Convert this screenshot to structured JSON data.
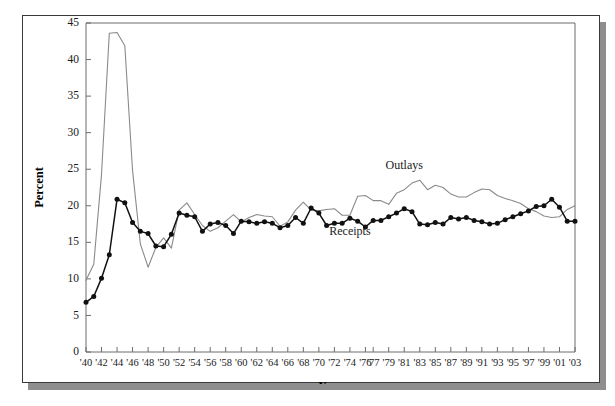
{
  "chart_data": {
    "type": "line",
    "title": "",
    "xlabel": "Year",
    "ylabel": "Percent",
    "grid": false,
    "legend_position": "inline-annotation",
    "xlim": [
      1940,
      2003
    ],
    "ylim": [
      0,
      45
    ],
    "ytick_values": [
      0,
      5,
      10,
      15,
      20,
      25,
      30,
      35,
      40,
      45
    ],
    "ytick_labels": [
      "0",
      "5",
      "10",
      "15",
      "20",
      "25",
      "30",
      "35",
      "40",
      "45"
    ],
    "xtick_labels": [
      "'40",
      "'42",
      "'44",
      "'46",
      "'48",
      "'50",
      "'52",
      "'54",
      "'56",
      "'58",
      "'60",
      "'62",
      "'64",
      "'66",
      "'68",
      "'70",
      "'72",
      "'74",
      "'76",
      "'77",
      "'79",
      "'81",
      "'83",
      "'85",
      "'87",
      "'89",
      "'91",
      "'93",
      "'95",
      "'97",
      "'99",
      "'01",
      "'03"
    ],
    "xtick_years": [
      1940,
      1942,
      1944,
      1946,
      1948,
      1950,
      1952,
      1954,
      1956,
      1958,
      1960,
      1962,
      1964,
      1966,
      1968,
      1970,
      1972,
      1974,
      1976,
      1977,
      1979,
      1981,
      1983,
      1985,
      1987,
      1989,
      1991,
      1993,
      1995,
      1997,
      1999,
      2001,
      2003
    ],
    "x": [
      1940,
      1941,
      1942,
      1943,
      1944,
      1945,
      1946,
      1947,
      1948,
      1949,
      1950,
      1951,
      1952,
      1953,
      1954,
      1955,
      1956,
      1957,
      1958,
      1959,
      1960,
      1961,
      1962,
      1963,
      1964,
      1965,
      1966,
      1967,
      1968,
      1969,
      1970,
      1971,
      1972,
      1973,
      1974,
      1975,
      1976,
      1977,
      1978,
      1979,
      1980,
      1981,
      1982,
      1983,
      1984,
      1985,
      1986,
      1987,
      1988,
      1989,
      1990,
      1991,
      1992,
      1993,
      1994,
      1995,
      1996,
      1997,
      1998,
      1999,
      2000,
      2001,
      2002,
      2003
    ],
    "series": [
      {
        "name": "Outlays",
        "color": "#8a8a8a",
        "marker": "none",
        "annotation": "Outlays",
        "annotation_x": 1981,
        "annotation_y": 25.0,
        "values": [
          9.8,
          12.0,
          24.3,
          43.6,
          43.7,
          41.9,
          24.8,
          14.8,
          11.6,
          14.3,
          15.6,
          14.2,
          19.4,
          20.4,
          18.8,
          17.3,
          16.5,
          17.0,
          17.9,
          18.8,
          17.8,
          18.4,
          18.8,
          18.6,
          18.5,
          17.2,
          17.8,
          19.4,
          20.5,
          19.4,
          19.3,
          19.5,
          19.6,
          18.7,
          18.7,
          21.3,
          21.4,
          20.7,
          20.7,
          20.2,
          21.7,
          22.2,
          23.1,
          23.5,
          22.2,
          22.8,
          22.5,
          21.6,
          21.2,
          21.2,
          21.8,
          22.3,
          22.2,
          21.4,
          21.0,
          20.7,
          20.3,
          19.6,
          19.2,
          18.6,
          18.4,
          18.5,
          19.5,
          20.0
        ]
      },
      {
        "name": "Receipts",
        "color": "#111111",
        "marker": "filled-circle",
        "annotation": "Receipts",
        "annotation_x": 1974,
        "annotation_y": 16.0,
        "values": [
          6.8,
          7.6,
          10.1,
          13.3,
          20.9,
          20.4,
          17.7,
          16.5,
          16.2,
          14.5,
          14.4,
          16.1,
          19.0,
          18.7,
          18.5,
          16.5,
          17.5,
          17.7,
          17.3,
          16.2,
          17.9,
          17.8,
          17.6,
          17.8,
          17.6,
          17.0,
          17.3,
          18.4,
          17.6,
          19.7,
          19.0,
          17.3,
          17.6,
          17.6,
          18.3,
          17.9,
          17.1,
          18.0,
          18.0,
          18.5,
          19.0,
          19.6,
          19.2,
          17.5,
          17.4,
          17.7,
          17.5,
          18.4,
          18.2,
          18.4,
          18.0,
          17.8,
          17.5,
          17.6,
          18.1,
          18.5,
          18.9,
          19.3,
          19.9,
          20.0,
          20.9,
          19.8,
          17.9,
          17.9
        ]
      }
    ]
  },
  "chart": {
    "ylabel": "Percent",
    "xlabel": "Year"
  }
}
